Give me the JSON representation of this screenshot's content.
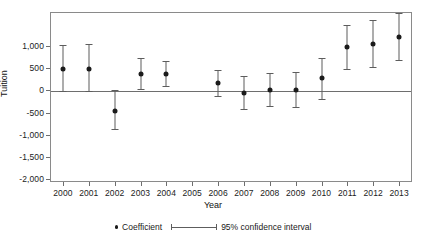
{
  "chart_data": {
    "type": "scatter",
    "title": "",
    "xlabel": "Year",
    "ylabel": "Tuition",
    "categories": [
      "2000",
      "2001",
      "2002",
      "2003",
      "2004",
      "2005",
      "2006",
      "2007",
      "2008",
      "2009",
      "2010",
      "2011",
      "2012",
      "2013"
    ],
    "xtick_labels": [
      "2000",
      "2001",
      "2002",
      "2003",
      "2004",
      "2005",
      "2006",
      "2007",
      "2008",
      "2009",
      "2010",
      "2011",
      "2012",
      "2013"
    ],
    "ytick_labels": [
      "1,000",
      "500",
      "0",
      "-500",
      "-1,000",
      "-1,500",
      "-2,000"
    ],
    "ytick_values": [
      1000,
      500,
      0,
      -500,
      -1000,
      -1500,
      -2000
    ],
    "ylim": [
      -2070,
      1775
    ],
    "grid": false,
    "legend_position": "bottom",
    "series": [
      {
        "name": "Coefficient",
        "values": [
          480,
          480,
          -460,
          380,
          380,
          null,
          170,
          -50,
          20,
          20,
          280,
          980,
          1060,
          1220
        ]
      },
      {
        "name": "95% confidence interval",
        "ci_low": [
          -10,
          -10,
          -880,
          30,
          110,
          null,
          -120,
          -410,
          -350,
          -370,
          -190,
          480,
          530,
          690
        ],
        "ci_high": [
          1020,
          1050,
          0,
          740,
          660,
          null,
          470,
          320,
          390,
          420,
          740,
          1480,
          1600,
          1760
        ]
      }
    ],
    "points": [
      {
        "year": "2000",
        "coefficient": 480,
        "ci_low": -10,
        "ci_high": 1020
      },
      {
        "year": "2001",
        "coefficient": 480,
        "ci_low": -10,
        "ci_high": 1050
      },
      {
        "year": "2002",
        "coefficient": -460,
        "ci_low": -880,
        "ci_high": 0
      },
      {
        "year": "2003",
        "coefficient": 380,
        "ci_low": 30,
        "ci_high": 740
      },
      {
        "year": "2004",
        "coefficient": 380,
        "ci_low": 110,
        "ci_high": 660
      },
      {
        "year": "2005",
        "coefficient": null,
        "ci_low": null,
        "ci_high": null
      },
      {
        "year": "2006",
        "coefficient": 170,
        "ci_low": -120,
        "ci_high": 470
      },
      {
        "year": "2007",
        "coefficient": -50,
        "ci_low": -410,
        "ci_high": 320
      },
      {
        "year": "2008",
        "coefficient": 20,
        "ci_low": -350,
        "ci_high": 390
      },
      {
        "year": "2009",
        "coefficient": 20,
        "ci_low": -370,
        "ci_high": 420
      },
      {
        "year": "2010",
        "coefficient": 280,
        "ci_low": -190,
        "ci_high": 740
      },
      {
        "year": "2011",
        "coefficient": 980,
        "ci_low": 480,
        "ci_high": 1480
      },
      {
        "year": "2012",
        "coefficient": 1060,
        "ci_low": 530,
        "ci_high": 1600
      },
      {
        "year": "2013",
        "coefficient": 1220,
        "ci_low": 690,
        "ci_high": 1760
      }
    ],
    "zero_line": 0
  },
  "legend": {
    "coefficient_label": "Coefficient",
    "ci_label": "95% confidence interval"
  },
  "colors": {
    "marker": "#1b1b1b",
    "error_bar": "#5d5d5d",
    "axis": "#8a8a8a",
    "zero_line": "#6e6e6e",
    "background": "#ffffff"
  }
}
